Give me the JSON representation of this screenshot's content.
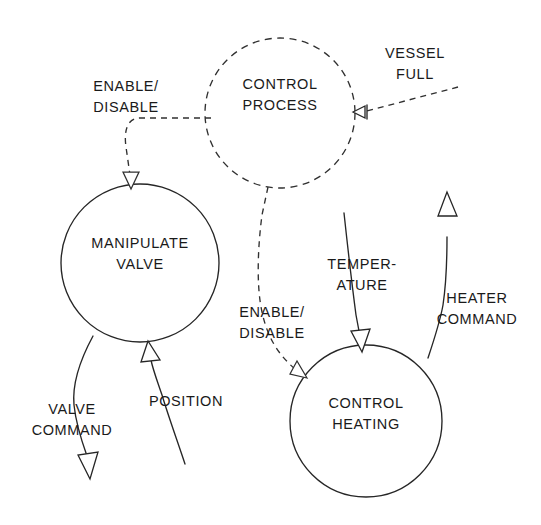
{
  "diagram": {
    "type": "data-flow-diagram",
    "background_color": "#ffffff",
    "line_color": "#262626",
    "text_color": "#1a1a1a",
    "processes": [
      {
        "id": "control-process",
        "label_line1": "CONTROL",
        "label_line2": "PROCESS",
        "border_style": "dashed",
        "cx": 280,
        "cy": 113,
        "r": 75
      },
      {
        "id": "manipulate-valve",
        "label_line1": "MANIPULATE",
        "label_line2": "VALVE",
        "border_style": "solid",
        "cx": 140,
        "cy": 263,
        "r": 79
      },
      {
        "id": "control-heating",
        "label_line1": "CONTROL",
        "label_line2": "HEATING",
        "border_style": "solid",
        "cx": 366,
        "cy": 421,
        "r": 76
      }
    ],
    "flows": [
      {
        "id": "vessel-full",
        "label_line1": "VESSEL",
        "label_line2": "FULL",
        "style": "dashed",
        "direction": "into-control-process"
      },
      {
        "id": "enable-disable-valve",
        "label_line1": "ENABLE/",
        "label_line2": "DISABLE",
        "style": "dashed",
        "direction": "control-process-to-manipulate-valve"
      },
      {
        "id": "enable-disable-heating",
        "label_line1": "ENABLE/",
        "label_line2": "DISABLE",
        "style": "dashed",
        "direction": "control-process-to-control-heating"
      },
      {
        "id": "valve-command",
        "label_line1": "VALVE",
        "label_line2": "COMMAND",
        "style": "solid",
        "direction": "out-of-manipulate-valve"
      },
      {
        "id": "position",
        "label_line1": "POSITION",
        "label_line2": "",
        "style": "solid",
        "direction": "into-manipulate-valve"
      },
      {
        "id": "temperature",
        "label_line1": "TEMPER-",
        "label_line2": "ATURE",
        "style": "solid",
        "direction": "into-control-heating"
      },
      {
        "id": "heater-command",
        "label_line1": "HEATER",
        "label_line2": "COMMAND",
        "style": "solid",
        "direction": "out-of-control-heating"
      }
    ]
  }
}
